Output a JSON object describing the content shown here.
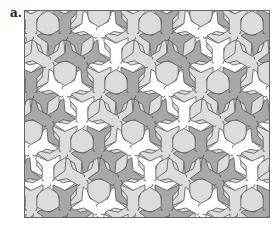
{
  "figure": {
    "label": "a.",
    "colors": {
      "dark_tile": "#a8a8a8",
      "light_tile": "#dcdcdc",
      "white_tile": "#ffffff",
      "outline": "#555555",
      "frame": "#666666"
    }
  }
}
